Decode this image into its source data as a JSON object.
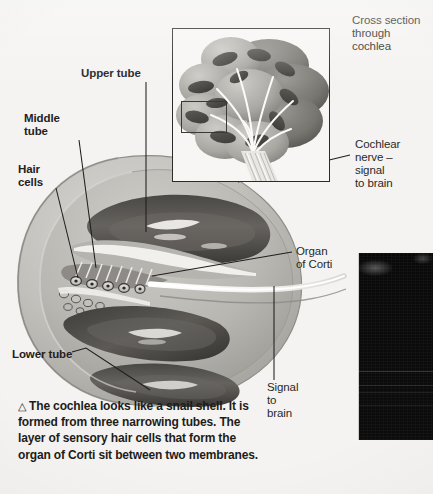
{
  "figure": {
    "title_hidden": "Cochlea cutaway diagram",
    "background_color": "#f4f3f1",
    "ink_color": "#23221f"
  },
  "labels": {
    "upper_tube": "Upper tube",
    "middle_tube_l1": "Middle",
    "middle_tube_l2": "tube",
    "hair_cells_l1": "Hair",
    "hair_cells_l2": "cells",
    "lower_tube": "Lower tube",
    "cross_section_l1": "Cross section",
    "cross_section_l2": "through",
    "cross_section_l3": "cochlea",
    "cochlear_nerve_l1": "Cochlear",
    "cochlear_nerve_l2": "nerve –",
    "cochlear_nerve_l3": "signal",
    "cochlear_nerve_l4": "to brain",
    "organ_of_corti_l1": "Organ",
    "organ_of_corti_l2": "of Corti",
    "signal_to_brain_l1": "Signal",
    "signal_to_brain_l2": "to",
    "signal_to_brain_l3": "brain"
  },
  "caption": {
    "marker": "△",
    "text": "The cochlea looks like a snail shell. It is formed from three narrowing tubes. The layer of sensory hair cells that form the organ of Corti sit between two membranes."
  },
  "photo_panel": {
    "description": "dark photographic inset",
    "color": "#0b0b0b"
  },
  "inset": {
    "description": "cochlea cross section illustration",
    "highlight_box": "region of interest"
  }
}
